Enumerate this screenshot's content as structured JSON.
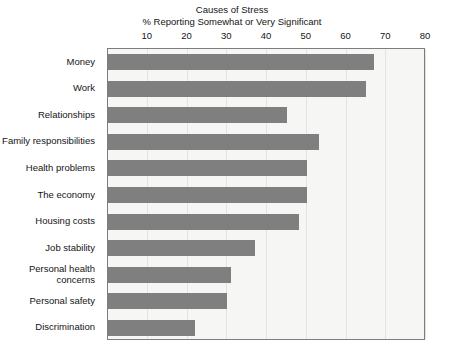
{
  "chart_data": {
    "type": "bar",
    "orientation": "horizontal",
    "title": "Causes of Stress",
    "subtitle": "% Reporting Somewhat or Very Significant",
    "xlabel": "",
    "ylabel": "",
    "xlim": [
      0,
      80
    ],
    "xticks": [
      10,
      20,
      30,
      40,
      50,
      60,
      70,
      80
    ],
    "grid": true,
    "legend": false,
    "bar_color": "#7f7f7f",
    "plot_background": "#f6f6f5",
    "categories": [
      "Money",
      "Work",
      "Relationships",
      "Family responsibilities",
      "Health problems",
      "The economy",
      "Housing costs",
      "Job stability",
      "Personal health\nconcerns",
      "Personal safety",
      "Discrimination"
    ],
    "values": [
      67,
      65,
      45,
      53,
      50,
      50,
      48,
      37,
      31,
      30,
      22
    ]
  }
}
